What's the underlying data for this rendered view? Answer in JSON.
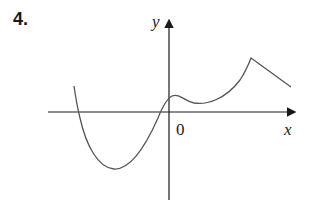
{
  "problem": {
    "number": "4."
  },
  "graph": {
    "y_label": "y",
    "x_label": "x",
    "origin_label": "0",
    "colors": {
      "axis": "#1a1a1a",
      "curve": "#555555"
    }
  }
}
